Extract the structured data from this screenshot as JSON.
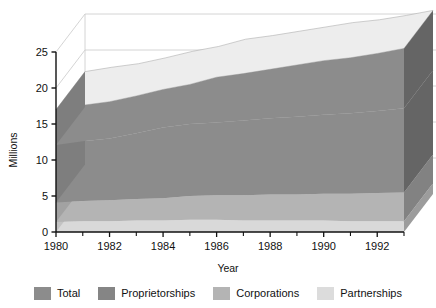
{
  "chart_data": {
    "type": "area",
    "title": "",
    "subtitle": "",
    "xlabel": "Year",
    "ylabel": "Millions",
    "xlim": [
      1980,
      1993
    ],
    "ylim": [
      0,
      25
    ],
    "grid": true,
    "stacked": true,
    "three_d": true,
    "legend_position": "bottom",
    "x": [
      1980,
      1981,
      1982,
      1983,
      1984,
      1985,
      1986,
      1987,
      1988,
      1989,
      1990,
      1991,
      1992,
      1993
    ],
    "xticks": [
      1980,
      1982,
      1984,
      1986,
      1988,
      1990,
      1992
    ],
    "xtick_labels": [
      "1980",
      "1982",
      "1984",
      "1986",
      "1988",
      "1990",
      "1992"
    ],
    "xminorticks": [
      1981,
      1983,
      1985,
      1987,
      1989,
      1991,
      1993
    ],
    "yticks": [
      0,
      5,
      10,
      15,
      20,
      25
    ],
    "ytick_labels": [
      "0",
      "5",
      "10",
      "15",
      "20",
      "25"
    ],
    "series": [
      {
        "name": "Partnerships",
        "color": "#d9d9d9",
        "values": [
          1.4,
          1.5,
          1.5,
          1.6,
          1.6,
          1.7,
          1.7,
          1.6,
          1.6,
          1.6,
          1.6,
          1.5,
          1.5,
          1.5
        ]
      },
      {
        "name": "Corporations",
        "color": "#b4b4b4",
        "values": [
          2.7,
          2.8,
          2.9,
          3.0,
          3.1,
          3.3,
          3.4,
          3.5,
          3.6,
          3.6,
          3.7,
          3.8,
          3.9,
          4.0
        ]
      },
      {
        "name": "Proprietorships",
        "color": "#8c8c8c",
        "values": [
          8.0,
          8.3,
          8.6,
          9.1,
          9.8,
          10.0,
          10.1,
          10.4,
          10.6,
          10.8,
          11.0,
          11.2,
          11.4,
          11.7
        ]
      },
      {
        "name": "Total",
        "color": "#8c8c8c",
        "values": [
          4.9,
          5.0,
          5.1,
          5.2,
          5.3,
          5.5,
          6.3,
          6.5,
          6.8,
          7.2,
          7.5,
          7.7,
          8.0,
          8.3
        ]
      }
    ]
  },
  "axes": {
    "y_title": "Millions",
    "x_title": "Year",
    "y_tick_0": "0",
    "y_tick_1": "5",
    "y_tick_2": "10",
    "y_tick_3": "15",
    "y_tick_4": "20",
    "y_tick_5": "25",
    "x_tick_0": "1980",
    "x_tick_1": "1982",
    "x_tick_2": "1984",
    "x_tick_3": "1986",
    "x_tick_4": "1988",
    "x_tick_5": "1990",
    "x_tick_6": "1992"
  },
  "legend": {
    "items": [
      {
        "label": "Total",
        "color": "#8c8c8c"
      },
      {
        "label": "Proprietorships",
        "color": "#858585"
      },
      {
        "label": "Corporations",
        "color": "#b4b4b4"
      },
      {
        "label": "Partnerships",
        "color": "#dcdcdc"
      }
    ]
  },
  "colors": {
    "background": "#ffffff",
    "axis": "#111111",
    "gridline": "#cfcfcf",
    "wall": "#ffffff",
    "band_total": "#8c8c8c",
    "band_proprietorships": "#858585",
    "band_corporations": "#b4b4b4",
    "band_partnerships": "#dcdcdc",
    "highlight": "#ededed",
    "side_dark": "#5e5e5e"
  }
}
